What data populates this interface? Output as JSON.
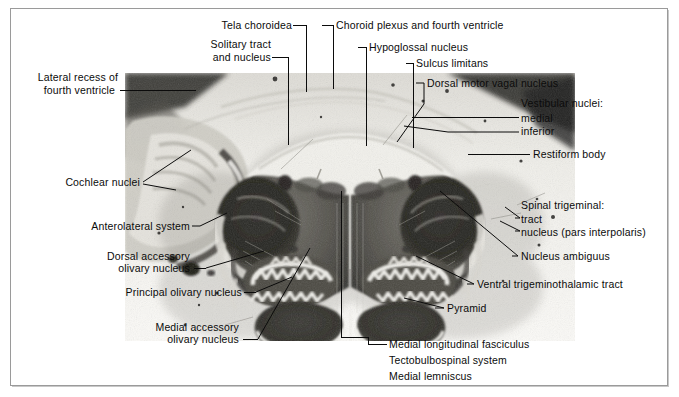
{
  "figure": {
    "specimen_alt": "Myelin-stained transverse section through the medulla oblongata at the level of the inferior olive"
  },
  "colors": {
    "ink": "#0b0b0b",
    "frame": "#9a9a9a",
    "frame_shadow": "#c8c8c8",
    "plate_background": "#ffffff",
    "specimen_light": "#efeee9",
    "specimen_mid": "#8f8d86",
    "specimen_dark": "#2a2a28"
  },
  "labels": {
    "tela_choroidea": "Tela choroidea",
    "solitary_tract_line1": "Solitary tract",
    "solitary_tract_line2": "and nucleus",
    "lateral_recess_line1": "Lateral recess of",
    "lateral_recess_line2": "fourth ventricle",
    "cochlear_nuclei": "Cochlear nuclei",
    "anterolateral_system": "Anterolateral system",
    "dorsal_accessory_line1": "Dorsal accessory",
    "dorsal_accessory_line2": "olivary nucleus",
    "principal_olivary": "Principal olivary nucleus",
    "medial_accessory_line1": "Medial accessory",
    "medial_accessory_line2": "olivary nucleus",
    "choroid_plexus": "Choroid plexus and fourth ventricle",
    "hypoglossal_nucleus": "Hypoglossal nucleus",
    "sulcus_limitans": "Sulcus limitans",
    "dorsal_motor_vagal": "Dorsal motor vagal nucleus",
    "vestibular_header": "Vestibular nuclei:",
    "vestibular_medial": "medial",
    "vestibular_inferior": "inferior",
    "restiform_body": "Restiform body",
    "spinal_trigeminal_header": "Spinal trigeminal:",
    "spinal_trigeminal_tract": "tract",
    "spinal_trigeminal_nucleus": "nucleus (pars interpolaris)",
    "nucleus_ambiguus": "Nucleus ambiguus",
    "ventral_trigeminothalamic": "Ventral trigeminothalamic tract",
    "pyramid": "Pyramid",
    "mlf": "Medial longitudinal fasciculus",
    "tectobulbospinal": "Tectobulbospinal system",
    "medial_lemniscus": "Medial lemniscus"
  }
}
